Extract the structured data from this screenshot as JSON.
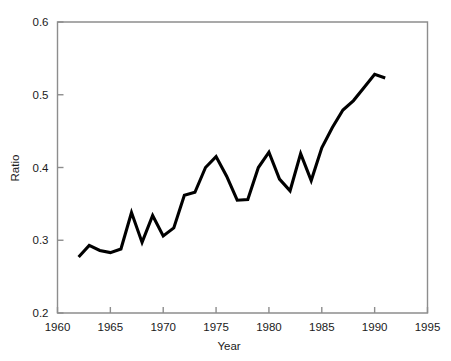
{
  "chart_data": {
    "type": "line",
    "title": "",
    "subtitle": "",
    "xlabel": "Year",
    "ylabel": "Ratio",
    "xlim": [
      1960,
      1995
    ],
    "ylim": [
      0.2,
      0.6
    ],
    "xticks": [
      1960,
      1965,
      1970,
      1975,
      1980,
      1985,
      1990,
      1995
    ],
    "xtick_labels": [
      "1960",
      "1965",
      "1970",
      "1975",
      "1980",
      "1985",
      "1990",
      "1995"
    ],
    "yticks": [
      0.2,
      0.3,
      0.4,
      0.5,
      0.6
    ],
    "ytick_labels": [
      "0.2",
      "0.3",
      "0.4",
      "0.5",
      "0.6"
    ],
    "grid": false,
    "legend": null,
    "line_color": "#000000",
    "line_width": 3,
    "markers": false,
    "x": [
      1962,
      1963,
      1964,
      1965,
      1966,
      1967,
      1968,
      1969,
      1970,
      1971,
      1972,
      1973,
      1974,
      1975,
      1976,
      1977,
      1978,
      1979,
      1980,
      1981,
      1982,
      1983,
      1984,
      1985,
      1986,
      1987,
      1988,
      1989,
      1990,
      1991
    ],
    "values": [
      0.277,
      0.293,
      0.286,
      0.283,
      0.288,
      0.338,
      0.297,
      0.334,
      0.306,
      0.317,
      0.362,
      0.366,
      0.4,
      0.415,
      0.388,
      0.355,
      0.356,
      0.4,
      0.421,
      0.384,
      0.368,
      0.419,
      0.382,
      0.427,
      0.455,
      0.479,
      0.492,
      0.51,
      0.528,
      0.523
    ],
    "series": [
      {
        "name": "Ratio",
        "values": [
          0.277,
          0.293,
          0.286,
          0.283,
          0.288,
          0.338,
          0.297,
          0.334,
          0.306,
          0.317,
          0.362,
          0.366,
          0.4,
          0.415,
          0.388,
          0.355,
          0.356,
          0.4,
          0.421,
          0.384,
          0.368,
          0.419,
          0.382,
          0.427,
          0.455,
          0.479,
          0.492,
          0.51,
          0.528,
          0.523
        ]
      }
    ]
  }
}
